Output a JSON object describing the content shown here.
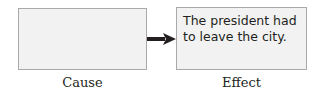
{
  "diagram": {
    "cause": {
      "label": "Cause",
      "text": ""
    },
    "effect": {
      "label": "Effect",
      "text": "The president had to leave the city."
    },
    "connector": {
      "direction": "cause-to-effect",
      "icon": "right-arrow-icon"
    }
  }
}
